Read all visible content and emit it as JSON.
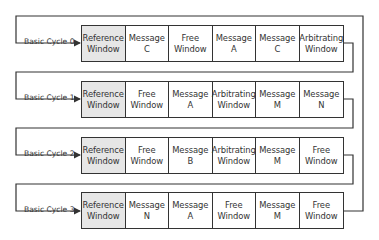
{
  "diagram": {
    "rows": [
      {
        "label": "Basic Cycle 0",
        "cells": [
          {
            "line1": "Reference",
            "line2": "Window",
            "type": "reference"
          },
          {
            "line1": "Message",
            "line2": "C",
            "type": "message"
          },
          {
            "line1": "Free",
            "line2": "Window",
            "type": "free"
          },
          {
            "line1": "Message",
            "line2": "A",
            "type": "message"
          },
          {
            "line1": "Message",
            "line2": "C",
            "type": "message"
          },
          {
            "line1": "Arbitrating",
            "line2": "Window",
            "type": "arbitrating"
          }
        ]
      },
      {
        "label": "Basic Cycle 1",
        "cells": [
          {
            "line1": "Reference",
            "line2": "Window",
            "type": "reference"
          },
          {
            "line1": "Free",
            "line2": "Window",
            "type": "free"
          },
          {
            "line1": "Message",
            "line2": "A",
            "type": "message"
          },
          {
            "line1": "Arbitrating",
            "line2": "Window",
            "type": "arbitrating"
          },
          {
            "line1": "Message",
            "line2": "M",
            "type": "message"
          },
          {
            "line1": "Message",
            "line2": "N",
            "type": "message"
          }
        ]
      },
      {
        "label": "Basic Cycle 2",
        "cells": [
          {
            "line1": "Reference",
            "line2": "Window",
            "type": "reference"
          },
          {
            "line1": "Free",
            "line2": "Window",
            "type": "free"
          },
          {
            "line1": "Message",
            "line2": "B",
            "type": "message"
          },
          {
            "line1": "Arbitrating",
            "line2": "Window",
            "type": "arbitrating"
          },
          {
            "line1": "Message",
            "line2": "M",
            "type": "message"
          },
          {
            "line1": "Free",
            "line2": "Window",
            "type": "free"
          }
        ]
      },
      {
        "label": "Basic Cycle 3",
        "cells": [
          {
            "line1": "Reference",
            "line2": "Window",
            "type": "reference"
          },
          {
            "line1": "Message",
            "line2": "N",
            "type": "message"
          },
          {
            "line1": "Message",
            "line2": "A",
            "type": "message"
          },
          {
            "line1": "Free",
            "line2": "Window",
            "type": "free"
          },
          {
            "line1": "Message",
            "line2": "M",
            "type": "message"
          },
          {
            "line1": "Free",
            "line2": "Window",
            "type": "free"
          }
        ]
      }
    ],
    "colors": {
      "line": "#333333",
      "reference_fill": "#e6e6e6",
      "cell_fill": "#ffffff"
    }
  }
}
